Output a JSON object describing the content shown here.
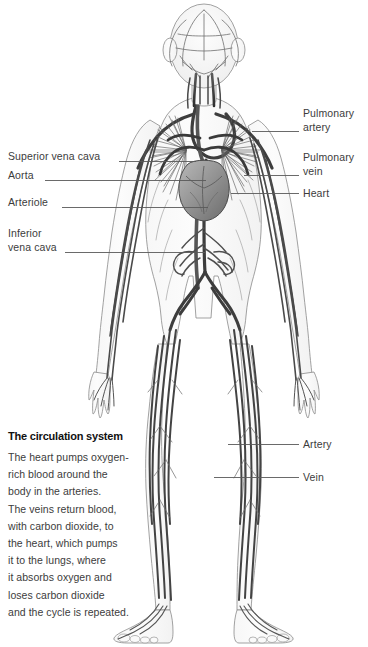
{
  "figure": {
    "title": "The circulation system",
    "background_color": "#ffffff",
    "ink_color": "#3c3c3c",
    "leader_color": "#555555"
  },
  "labels_left": [
    {
      "id": "superior-vena-cava",
      "text": "Superior vena cava",
      "x": 8,
      "y": 150,
      "leader_x1": 119,
      "leader_y1": 161,
      "leader_x2": 196,
      "leader_y2": 161
    },
    {
      "id": "aorta",
      "text": "Aorta",
      "x": 8,
      "y": 169,
      "leader_x1": 45,
      "leader_y1": 180,
      "leader_x2": 206,
      "leader_y2": 180
    },
    {
      "id": "arteriole",
      "text": "Arteriole",
      "x": 8,
      "y": 196,
      "leader_x1": 62,
      "leader_y1": 207,
      "leader_x2": 208,
      "leader_y2": 207
    },
    {
      "id": "inferior-vena-cava",
      "text": "Inferior\nvena cava",
      "x": 8,
      "y": 227,
      "leader_x1": 65,
      "leader_y1": 252,
      "leader_x2": 205,
      "leader_y2": 252
    }
  ],
  "labels_right": [
    {
      "id": "pulmonary-artery",
      "text": "Pulmonary\nartery",
      "x": 303,
      "y": 107,
      "leader_x1": 252,
      "leader_y1": 131,
      "leader_x2": 299,
      "leader_y2": 131
    },
    {
      "id": "pulmonary-vein",
      "text": "Pulmonary\nvein",
      "x": 303,
      "y": 151,
      "leader_x1": 244,
      "leader_y1": 175,
      "leader_x2": 299,
      "leader_y2": 175
    },
    {
      "id": "heart",
      "text": "Heart",
      "x": 303,
      "y": 187,
      "leader_x1": 231,
      "leader_y1": 193,
      "leader_x2": 299,
      "leader_y2": 193
    },
    {
      "id": "artery",
      "text": "Artery",
      "x": 303,
      "y": 438,
      "leader_x1": 228,
      "leader_y1": 444,
      "leader_x2": 299,
      "leader_y2": 444
    },
    {
      "id": "vein",
      "text": "Vein",
      "x": 303,
      "y": 471,
      "leader_x1": 214,
      "leader_y1": 477,
      "leader_x2": 299,
      "leader_y2": 477
    }
  ],
  "caption": {
    "title": "The circulation system",
    "body": "The heart pumps oxygen-\nrich blood around the\nbody in the arteries.\nThe veins return blood,\nwith carbon dioxide, to\nthe heart, which pumps\nit to the lungs, where\nit absorbs oxygen and\nloses carbon dioxide\nand the cycle is repeated."
  }
}
